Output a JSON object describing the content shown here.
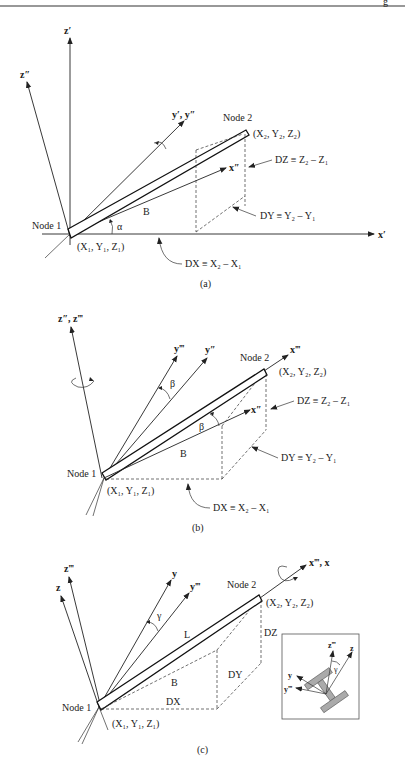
{
  "page": {
    "header_rule": true,
    "corner_glyph": "g"
  },
  "figure_a": {
    "caption": "(a)",
    "axes": {
      "z_prime": "z′",
      "z_dprime": "z″",
      "y_prime": "y′, y″",
      "x_dprime": "x″",
      "x_prime": "x′"
    },
    "node1": "Node 1",
    "node2": "Node 2",
    "node1_coords": "(X₁, Y₁, Z₁)",
    "node2_coords": "(X₂, Y₂, Z₂)",
    "angle": "α",
    "projection_label": "B",
    "dz": "DZ ≡ Z₂ – Z₁",
    "dy": "DY ≡ Y₂ – Y₁",
    "dx": "DX ≡ X₂ – X₁"
  },
  "figure_b": {
    "caption": "(b)",
    "axes": {
      "z": "z″, z‴",
      "y_tprime": "y‴",
      "y_dprime": "y″",
      "x_tprime": "x‴",
      "x_dprime": "x″"
    },
    "node1": "Node 1",
    "node2": "Node 2",
    "node1_coords": "(X₁, Y₁, Z₁)",
    "node2_coords": "(X₂, Y₂, Z₂)",
    "angle_top": "β",
    "angle_bottom": "β",
    "projection_label": "B",
    "dz": "DZ ≡ Z₂ – Z₁",
    "dy": "DY ≡ Y₂ – Y₁",
    "dx": "DX ≡ X₂ – X₁"
  },
  "figure_c": {
    "caption": "(c)",
    "axes": {
      "z_tprime": "z‴",
      "z": "z",
      "y": "y",
      "y_tprime": "y‴",
      "x": "x‴, x"
    },
    "node1": "Node 1",
    "node2": "Node 2",
    "node1_coords": "(X₁, Y₁, Z₁)",
    "node2_coords": "(X₂, Y₂, Z₂)",
    "angle": "γ",
    "length_label": "L",
    "projection_label": "B",
    "dz": "DZ",
    "dy": "DY",
    "dx": "DX",
    "inset": {
      "z_tprime": "z‴",
      "z": "z",
      "y": "y",
      "y_tprime": "y‴",
      "angle": "γ"
    }
  }
}
